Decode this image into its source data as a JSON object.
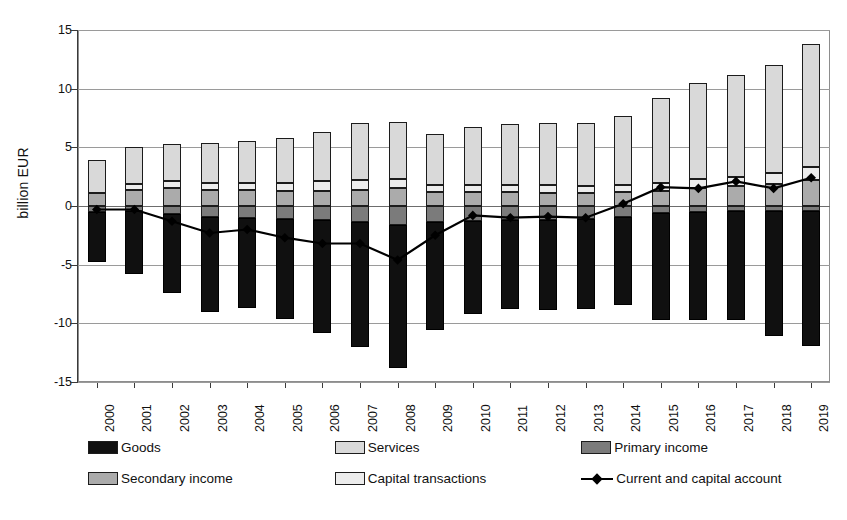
{
  "chart_data": {
    "type": "bar",
    "title": "",
    "subtitle": "",
    "xlabel": "",
    "ylabel": "billion EUR",
    "ylim": [
      -15,
      15
    ],
    "ytick_values": [
      15,
      10,
      5,
      0,
      -5,
      -10,
      -15
    ],
    "ytick_labels": [
      "15",
      "10",
      "5",
      "0",
      "-5",
      "-10",
      "-15"
    ],
    "grid": true,
    "stacked": true,
    "legend_position": "bottom",
    "categories": [
      "2000",
      "2001",
      "2002",
      "2003",
      "2004",
      "2005",
      "2006",
      "2007",
      "2008",
      "2009",
      "2010",
      "2011",
      "2012",
      "2013",
      "2014",
      "2015",
      "2016",
      "2017",
      "2018",
      "2019"
    ],
    "series": [
      {
        "name": "Goods",
        "color": "#101010",
        "type": "bar",
        "values": [
          -4.3,
          -5.4,
          -6.7,
          -8.1,
          -7.7,
          -8.5,
          -9.6,
          -10.6,
          -12.2,
          -9.2,
          -7.9,
          -7.6,
          -7.7,
          -7.7,
          -7.5,
          -9.1,
          -9.2,
          -9.3,
          -10.7,
          -11.5
        ]
      },
      {
        "name": "Services",
        "color": "#d9d9d9",
        "type": "bar",
        "values": [
          2.8,
          3.1,
          3.2,
          3.4,
          3.5,
          3.8,
          4.2,
          4.9,
          4.9,
          4.3,
          4.9,
          5.2,
          5.3,
          5.4,
          5.9,
          7.2,
          8.2,
          8.7,
          9.2,
          10.5
        ]
      },
      {
        "name": "Primary income",
        "color": "#7b7b7b",
        "type": "bar",
        "values": [
          -0.5,
          -0.4,
          -0.7,
          -0.9,
          -1.0,
          -1.1,
          -1.2,
          -1.4,
          -1.6,
          -1.4,
          -1.3,
          -1.2,
          -1.2,
          -1.1,
          -0.9,
          -0.6,
          -0.5,
          -0.4,
          -0.4,
          -0.4
        ]
      },
      {
        "name": "Secondary income",
        "color": "#ababab",
        "type": "bar",
        "values": [
          1.1,
          1.4,
          1.5,
          1.4,
          1.4,
          1.3,
          1.3,
          1.4,
          1.5,
          1.2,
          1.2,
          1.2,
          1.1,
          1.1,
          1.2,
          1.3,
          1.5,
          1.7,
          1.9,
          2.2
        ]
      },
      {
        "name": "Capital transactions",
        "color": "#ececec",
        "type": "bar",
        "values": [
          0.0,
          0.5,
          0.6,
          0.6,
          0.6,
          0.7,
          0.8,
          0.8,
          0.8,
          0.6,
          0.6,
          0.6,
          0.7,
          0.6,
          0.6,
          0.7,
          0.8,
          0.8,
          0.9,
          1.1
        ]
      },
      {
        "name": "Current and capital account",
        "color": "#000000",
        "type": "line",
        "marker": "diamond",
        "values": [
          -0.3,
          -0.3,
          -1.3,
          -2.3,
          -2.0,
          -2.7,
          -3.2,
          -3.2,
          -4.6,
          -2.5,
          -0.8,
          -1.0,
          -0.9,
          -1.0,
          0.2,
          1.6,
          1.5,
          2.1,
          1.5,
          2.4
        ]
      }
    ]
  },
  "axis": {
    "y_title": "billion EUR",
    "y_labels": [
      "15",
      "10",
      "5",
      "0",
      "-5",
      "-10",
      "-15"
    ],
    "x_labels": [
      "2000",
      "2001",
      "2002",
      "2003",
      "2004",
      "2005",
      "2006",
      "2007",
      "2008",
      "2009",
      "2010",
      "2011",
      "2012",
      "2013",
      "2014",
      "2015",
      "2016",
      "2017",
      "2018",
      "2019"
    ]
  },
  "legend": {
    "items": [
      {
        "label": "Goods",
        "swatch": "goods",
        "kind": "box"
      },
      {
        "label": "Services",
        "swatch": "services",
        "kind": "box"
      },
      {
        "label": "Primary income",
        "swatch": "primary",
        "kind": "box"
      },
      {
        "label": "Secondary income",
        "swatch": "secondary",
        "kind": "box"
      },
      {
        "label": "Capital transactions",
        "swatch": "capital",
        "kind": "box"
      },
      {
        "label": "Current and capital account",
        "swatch": "line",
        "kind": "line"
      }
    ]
  }
}
